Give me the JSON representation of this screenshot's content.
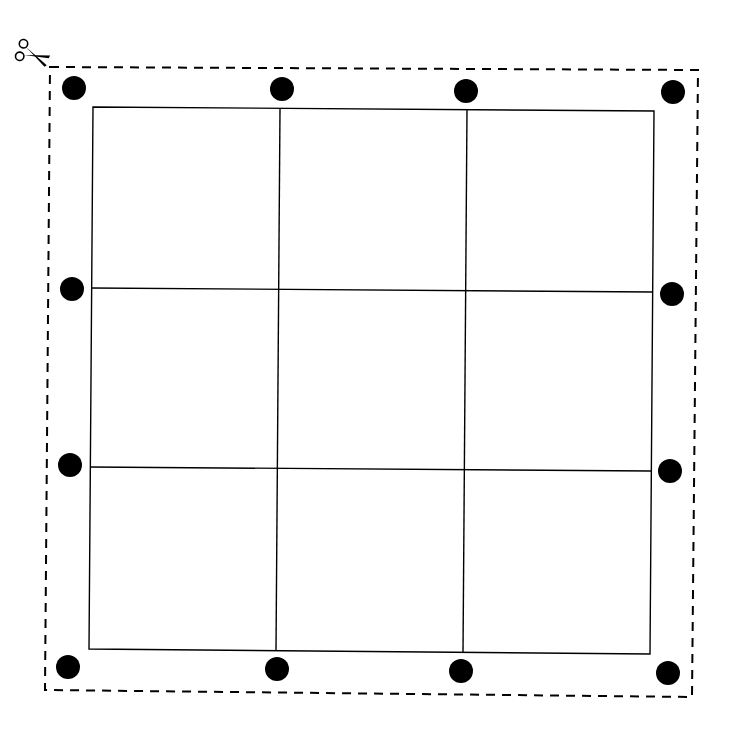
{
  "diagram": {
    "type": "cut-out template: 3x3 grid with punch holes",
    "colors": {
      "line": "#000000",
      "background": "#ffffff",
      "dot": "#000000"
    },
    "cut_border": {
      "style": "dashed",
      "corners": [
        [
          50,
          67
        ],
        [
          698,
          70
        ],
        [
          692,
          697
        ],
        [
          45,
          690
        ]
      ]
    },
    "scissors": {
      "x": 32,
      "y": 55
    },
    "grid": {
      "rows": 3,
      "cols": 3,
      "outer": [
        [
          93,
          107
        ],
        [
          654,
          111
        ],
        [
          650,
          654
        ],
        [
          89,
          649
        ]
      ],
      "vertical_lines": [
        {
          "x1": 280,
          "y1": 109,
          "x2": 276,
          "y2": 651
        },
        {
          "x1": 467,
          "y1": 110,
          "x2": 463,
          "y2": 652
        }
      ],
      "horizontal_lines": [
        {
          "x1": 91,
          "y1": 288,
          "x2": 653,
          "y2": 292
        },
        {
          "x1": 90,
          "y1": 467,
          "x2": 651,
          "y2": 471
        }
      ]
    },
    "dots": [
      {
        "x": 74,
        "y": 88
      },
      {
        "x": 282,
        "y": 89
      },
      {
        "x": 466,
        "y": 91
      },
      {
        "x": 673,
        "y": 92
      },
      {
        "x": 72,
        "y": 289
      },
      {
        "x": 672,
        "y": 294
      },
      {
        "x": 70,
        "y": 465
      },
      {
        "x": 670,
        "y": 471
      },
      {
        "x": 68,
        "y": 667
      },
      {
        "x": 277,
        "y": 669
      },
      {
        "x": 461,
        "y": 671
      },
      {
        "x": 668,
        "y": 673
      }
    ],
    "dot_radius": 12
  }
}
